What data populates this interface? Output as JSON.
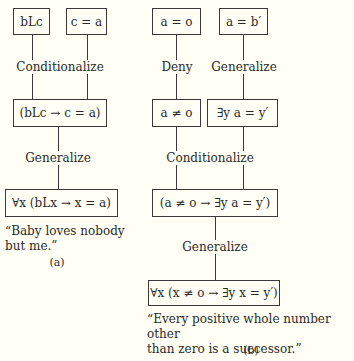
{
  "diagram_a": {
    "premises": [
      "bLc",
      "c = a"
    ],
    "step1_label": "Conditionalize",
    "step1_result": "(bLc → c = a)",
    "step2_label": "Generalize",
    "conclusion": "∀x (bLx → x = a)",
    "caption": "“Baby loves nobody but me.”",
    "caption_line1": "“Baby loves nobody",
    "caption_line2": "but me.”",
    "sublabel": "(a)"
  },
  "diagram_b": {
    "premises": [
      "a = o",
      "a = b′"
    ],
    "deny_label": "Deny",
    "generalize1_label": "Generalize",
    "intermediate": [
      "a ≠ o",
      "∃y a = y′"
    ],
    "conditionalize_label": "Conditionalize",
    "conditional_result": "(a ≠ o → ∃y a = y′)",
    "generalize2_label": "Generalize",
    "conclusion": "∀x (x ≠ o → ∃y x = y′)",
    "caption_line1": "“Every positive whole number other",
    "caption_line2": "than zero is a successor.”",
    "sublabel": "(b)"
  }
}
